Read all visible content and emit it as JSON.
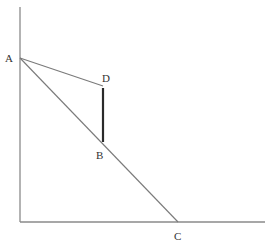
{
  "diagram": {
    "type": "geometric-economics-diagram",
    "axes": {
      "origin": {
        "x": 20,
        "y": 222
      },
      "y_axis_top": {
        "x": 20,
        "y": 7
      },
      "x_axis_right": {
        "x": 265,
        "y": 222
      }
    },
    "points": {
      "A": {
        "label": "A",
        "x": 20,
        "y": 58
      },
      "B": {
        "label": "B",
        "x": 103,
        "y": 143
      },
      "C": {
        "label": "C",
        "x": 178,
        "y": 222
      },
      "D": {
        "label": "D",
        "x": 103,
        "y": 85
      }
    },
    "segments": [
      {
        "from": "A",
        "to": "C",
        "style": "thin"
      },
      {
        "from": "A",
        "to": "D",
        "style": "thin"
      },
      {
        "from": "D",
        "to": "B",
        "style": "thick"
      }
    ],
    "colors": {
      "axis": "#8a8a8a",
      "thin_line": "#7a7a7a",
      "thick_line": "#2a2a2a",
      "label": "#333333",
      "background": "#ffffff"
    }
  }
}
